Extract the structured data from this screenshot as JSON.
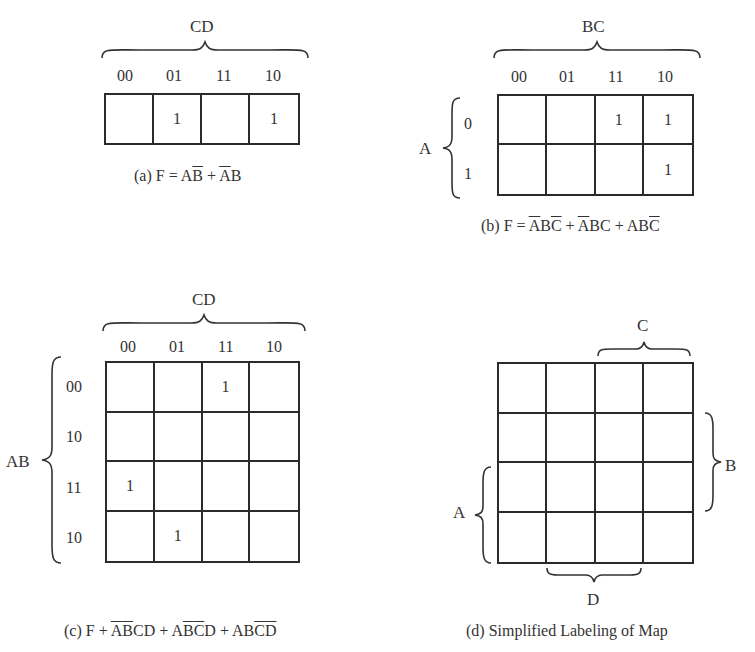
{
  "figures": {
    "a": {
      "variable_label": "CD",
      "col_labels": [
        "00",
        "01",
        "11",
        "10"
      ],
      "cells": [
        [
          "",
          "1",
          "",
          "1"
        ]
      ],
      "caption": {
        "prefix": "(a) F = ",
        "terms": [
          [
            {
              "t": "A",
              "bar": false
            },
            {
              "t": "B",
              "bar": true
            }
          ],
          [
            {
              "t": "A",
              "bar": true
            },
            {
              "t": "B",
              "bar": false
            }
          ]
        ],
        "text": "(a) F = AB̄ + ĀB"
      }
    },
    "b": {
      "col_variable_label": "BC",
      "row_variable_label": "A",
      "col_labels": [
        "00",
        "01",
        "11",
        "10"
      ],
      "row_labels": [
        "0",
        "1"
      ],
      "cells": [
        [
          "",
          "",
          "1",
          "1"
        ],
        [
          "",
          "",
          "",
          "1"
        ]
      ],
      "caption": {
        "prefix": "(b) F = ",
        "terms": [
          [
            {
              "t": "A",
              "bar": true
            },
            {
              "t": "B",
              "bar": false
            },
            {
              "t": "C",
              "bar": true
            }
          ],
          [
            {
              "t": "A",
              "bar": true
            },
            {
              "t": "B",
              "bar": false
            },
            {
              "t": "C",
              "bar": false
            }
          ],
          [
            {
              "t": "A",
              "bar": false
            },
            {
              "t": "B",
              "bar": false
            },
            {
              "t": "C",
              "bar": true
            }
          ]
        ],
        "text": "(b) F = ĀBC̄ + ĀBC + ABC̄"
      }
    },
    "c": {
      "col_variable_label": "CD",
      "row_variable_label": "AB",
      "col_labels": [
        "00",
        "01",
        "11",
        "10"
      ],
      "row_labels": [
        "00",
        "10",
        "11",
        "10"
      ],
      "cells": [
        [
          "",
          "",
          "1",
          ""
        ],
        [
          "",
          "",
          "",
          ""
        ],
        [
          "1",
          "",
          "",
          ""
        ],
        [
          "",
          "1",
          "",
          ""
        ]
      ],
      "caption": {
        "prefix": "(c) F + ",
        "terms": [
          [
            {
              "t": "A",
              "bar": true
            },
            {
              "t": "B",
              "bar": true
            },
            {
              "t": "C",
              "bar": false
            },
            {
              "t": "D",
              "bar": false
            }
          ],
          [
            {
              "t": "A",
              "bar": false
            },
            {
              "t": "B",
              "bar": true
            },
            {
              "t": "C",
              "bar": true
            },
            {
              "t": "D",
              "bar": false
            }
          ],
          [
            {
              "t": "A",
              "bar": false
            },
            {
              "t": "B",
              "bar": false
            },
            {
              "t": "C",
              "bar": true
            },
            {
              "t": "D",
              "bar": true
            }
          ]
        ],
        "text": "(c) F + ĀB̄CD + AB̄C̄D + ABC̄D̄"
      }
    },
    "d": {
      "labels": {
        "A": "A",
        "B": "B",
        "C": "C",
        "D": "D"
      },
      "cells": [
        [
          "",
          "",
          "",
          ""
        ],
        [
          "",
          "",
          "",
          ""
        ],
        [
          "",
          "",
          "",
          ""
        ],
        [
          "",
          "",
          "",
          ""
        ]
      ],
      "caption": {
        "text": "(d) Simplified Labeling of Map"
      }
    }
  }
}
